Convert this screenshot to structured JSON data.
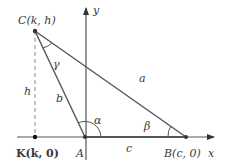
{
  "diagram": {
    "type": "triangle-coordinate-figure",
    "colors": {
      "line": "#555555",
      "point": "#333333",
      "text": "#3a3a3a",
      "dashed": "#8a8a8a"
    },
    "axes": {
      "x_label": "x",
      "y_label": "y"
    },
    "points": {
      "C": {
        "label": "C(k, h)",
        "name": "C",
        "coords": "(k, h)"
      },
      "A": {
        "label": "A",
        "name": "A"
      },
      "B": {
        "label": "B(c, 0)",
        "name": "B",
        "coords": "(c, 0)"
      },
      "K": {
        "label": "K(k, 0)",
        "name": "K",
        "coords": "(k, 0)"
      }
    },
    "sides": {
      "a": "a",
      "b": "b",
      "c": "c",
      "h": "h"
    },
    "angles": {
      "alpha": "α",
      "beta": "β",
      "gamma": "γ"
    }
  }
}
